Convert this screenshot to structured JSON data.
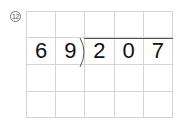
{
  "problem": {
    "number_label": "12",
    "divisor": [
      "6",
      "9"
    ],
    "dividend": [
      "2",
      "0",
      "7"
    ],
    "rows": [
      [
        "",
        "",
        "",
        "",
        ""
      ],
      [
        "6",
        "9",
        "2",
        "0",
        "7"
      ],
      [
        "",
        "",
        "",
        "",
        ""
      ],
      [
        "",
        "",
        "",
        "",
        ""
      ]
    ]
  }
}
